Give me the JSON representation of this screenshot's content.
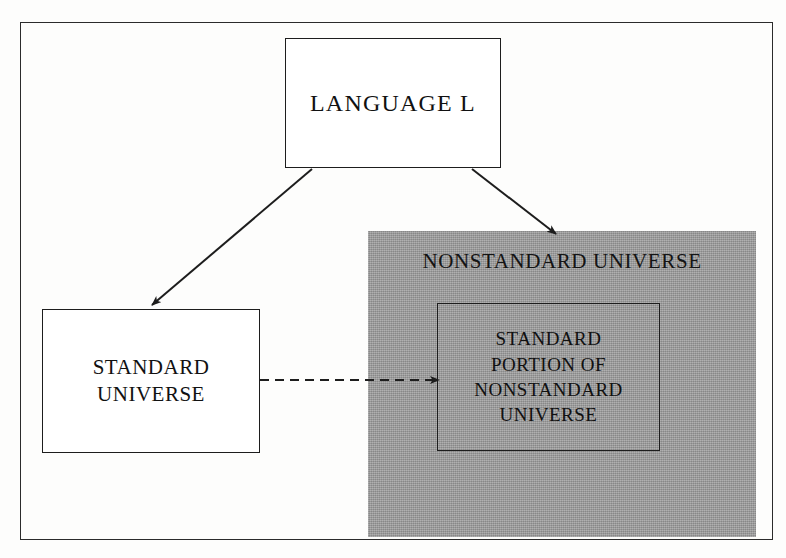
{
  "figure": {
    "title_text_present": false,
    "background_color": "#fdfdfc",
    "frame_color": "#2b2b2b",
    "shaded_region_color": "#9b9b9b",
    "line_color": "#1d1d1d"
  },
  "nodes": {
    "language": {
      "label": "LANGUAGE L",
      "shape": "rectangle",
      "fill": "#ffffff"
    },
    "standard_universe": {
      "label": "STANDARD\nUNIVERSE",
      "shape": "rectangle",
      "fill": "#ffffff"
    },
    "nonstandard_universe": {
      "label": "NONSTANDARD UNIVERSE",
      "shape": "shaded-region",
      "fill": "#9b9b9b"
    },
    "standard_portion": {
      "label": "STANDARD\nPORTION OF\nNONSTANDARD\nUNIVERSE",
      "shape": "rectangle",
      "fill": "transparent"
    }
  },
  "edges": [
    {
      "id": "language-to-standard",
      "from": "language",
      "to": "standard_universe",
      "style": "solid",
      "arrowhead": "filled",
      "label": ""
    },
    {
      "id": "language-to-nonstandard",
      "from": "language",
      "to": "nonstandard_universe",
      "style": "solid",
      "arrowhead": "filled",
      "label": ""
    },
    {
      "id": "standard-to-standard-portion",
      "from": "standard_universe",
      "to": "standard_portion",
      "style": "dashed",
      "arrowhead": "filled",
      "label": ""
    }
  ]
}
